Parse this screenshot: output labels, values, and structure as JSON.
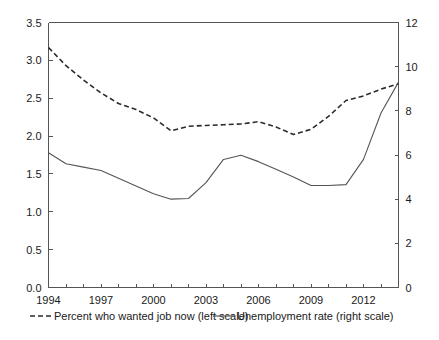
{
  "chart_data": {
    "type": "line",
    "title": "",
    "subtitle": "",
    "xlabel": "",
    "ylabel": "",
    "grid": false,
    "legend_position": "bottom",
    "x": [
      1994,
      1995,
      1996,
      1997,
      1998,
      1999,
      2000,
      2001,
      2002,
      2003,
      2004,
      2005,
      2006,
      2007,
      2008,
      2009,
      2010,
      2011,
      2012,
      2013,
      2014
    ],
    "x_tick_labels": [
      "1994",
      "1997",
      "2000",
      "2003",
      "2006",
      "2009",
      "2012"
    ],
    "x_tick_values": [
      1994,
      1997,
      2000,
      2003,
      2006,
      2009,
      2012
    ],
    "xlim": [
      1994,
      2014
    ],
    "x_minor_tick_step": 1,
    "left_axis": {
      "label": "",
      "ylim": [
        0.0,
        3.5
      ],
      "tick_step": 0.5,
      "tick_labels": [
        "0.0",
        "0.5",
        "1.0",
        "1.5",
        "2.0",
        "2.5",
        "3.0",
        "3.5"
      ],
      "tick_values": [
        0.0,
        0.5,
        1.0,
        1.5,
        2.0,
        2.5,
        3.0,
        3.5
      ]
    },
    "right_axis": {
      "label": "",
      "ylim": [
        0,
        12
      ],
      "tick_step": 2,
      "tick_labels": [
        "0",
        "2",
        "4",
        "6",
        "8",
        "10",
        "12"
      ],
      "tick_values": [
        0,
        2,
        4,
        6,
        8,
        10,
        12
      ]
    },
    "series": [
      {
        "name": "Percent who wanted job now (left scale)",
        "axis": "left",
        "style": "dashed",
        "color": "#2b2b2b",
        "values": [
          3.17,
          2.93,
          2.74,
          2.57,
          2.43,
          2.35,
          2.24,
          2.07,
          2.13,
          2.14,
          2.15,
          2.16,
          2.19,
          2.12,
          2.02,
          2.09,
          2.26,
          2.47,
          2.53,
          2.62,
          2.69
        ]
      },
      {
        "name": "Unemployment rate (right scale)",
        "axis": "right",
        "style": "solid",
        "color": "#555555",
        "values": [
          6.1,
          5.6,
          5.45,
          5.3,
          4.95,
          4.6,
          4.25,
          4.0,
          4.03,
          4.75,
          5.8,
          5.99,
          5.7,
          5.35,
          5.0,
          4.62,
          4.62,
          4.66,
          5.8,
          7.9,
          9.3
        ]
      }
    ],
    "annotations": []
  },
  "legend": {
    "entries": [
      {
        "label": "Percent who wanted job now (left scale)",
        "style": "dashed",
        "color": "#2b2b2b"
      },
      {
        "label": "Unemployment rate (right scale)",
        "style": "solid",
        "color": "#555555"
      }
    ]
  }
}
